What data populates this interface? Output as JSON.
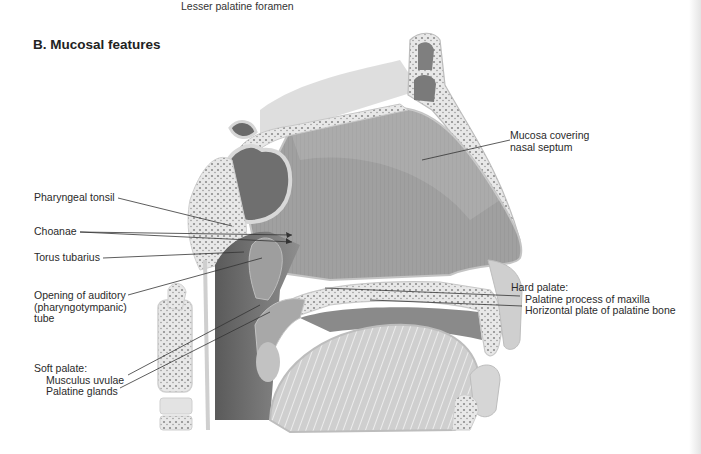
{
  "header": {
    "partial_label_top": "Lesser palatine foramen",
    "section_title": "B. Mucosal features"
  },
  "figure": {
    "type": "anatomical-illustration",
    "view": "sagittal section of nasal cavity, pharynx and palate",
    "colors": {
      "mucosa": "#9a9a9a",
      "mucosa_dark": "#6e6e6e",
      "bone": "#e6e6e6",
      "bone_texture": "#8a8a8a",
      "outline": "#bdbdbd",
      "label_text": "#2a2a2a",
      "leader_line": "#333333"
    }
  },
  "labels": {
    "left": [
      {
        "id": "pharyngeal-tonsil",
        "text": "Pharyngeal tonsil"
      },
      {
        "id": "choanae",
        "text": "Choanae"
      },
      {
        "id": "torus-tubarius",
        "text": "Torus tubarius"
      },
      {
        "id": "auditory-tube",
        "lines": [
          "Opening of auditory",
          "(pharyngotympanic)",
          "tube"
        ]
      },
      {
        "id": "soft-palate",
        "heading": "Soft palate:",
        "items": [
          "Musculus uvulae",
          "Palatine glands"
        ]
      }
    ],
    "right": [
      {
        "id": "mucosa-septum",
        "lines": [
          "Mucosa covering",
          "nasal septum"
        ]
      },
      {
        "id": "hard-palate",
        "heading": "Hard palate:",
        "items": [
          "Palatine process of maxilla",
          "Horizontal plate of palatine bone"
        ]
      }
    ]
  }
}
